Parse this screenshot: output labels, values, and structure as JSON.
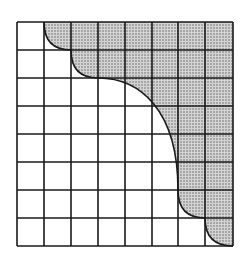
{
  "diagram": {
    "type": "grid-with-shaded-region",
    "grid": {
      "columns": 8,
      "rows": 8,
      "x_lines": [
        17,
        44,
        71,
        98,
        125,
        152,
        178,
        205,
        233
      ],
      "y_lines": [
        22,
        50,
        78,
        106,
        134,
        162,
        190,
        218,
        246
      ],
      "line_color": "#1a1a1a"
    },
    "shaded_region": {
      "position": "upper-right",
      "fill_pattern": "stipple-dots",
      "fill_color": "#c8c8c8",
      "dot_color": "#555555",
      "boundary_curve": "M44,22 Q44,50 71,50 Q71,78 98,78 C140,78 178,110 178,190 Q178,218 205,218 Q205,246 233,246"
    },
    "colors": {
      "background": "#ffffff",
      "stroke": "#1a1a1a"
    }
  }
}
